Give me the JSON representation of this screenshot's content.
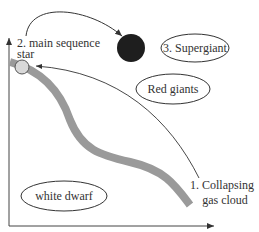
{
  "diagram": {
    "colors": {
      "main_sequence_band": "#9a9a9a",
      "main_sequence_star": "#d8d8d8",
      "supergiant": "#1e1e1e",
      "lines": "#333333"
    },
    "labels": {
      "main_sequence_line1": "2. main sequence",
      "main_sequence_line2": "star",
      "supergiant": "3. Supergiant",
      "red_giants": "Red giants",
      "white_dwarf": "white dwarf",
      "collapsing_line1": "1. Collapsing",
      "collapsing_line2": "gas cloud"
    },
    "arrows": [
      {
        "from": "main-sequence-star",
        "to": "supergiant"
      },
      {
        "from": "collapsing-gas-cloud",
        "to": "main-sequence-star"
      }
    ],
    "axes": {
      "x_arrow": true,
      "y_arrow": true
    }
  }
}
